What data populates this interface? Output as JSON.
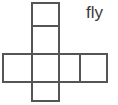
{
  "figure": {
    "kind": "cube-net-diagram",
    "label": "fly",
    "stroke_color": "#555555",
    "fill_color": "#ffffff",
    "background_color": "#ffffff",
    "stroke_width": 2,
    "canvas": {
      "width": 118,
      "height": 105
    },
    "grid": {
      "vertical_line_x": [
        2,
        31,
        60,
        80,
        108
      ],
      "horizontal_line_y": [
        2,
        26,
        54,
        82,
        102
      ]
    },
    "squares": [
      {
        "name": "top-cell",
        "x": 31,
        "y": 2,
        "width": 29,
        "height": 24
      },
      {
        "name": "upper-middle-cell",
        "x": 31,
        "y": 26,
        "width": 29,
        "height": 28
      },
      {
        "name": "center-cell",
        "x": 31,
        "y": 54,
        "width": 29,
        "height": 28
      },
      {
        "name": "bottom-cell",
        "x": 31,
        "y": 82,
        "width": 29,
        "height": 20
      },
      {
        "name": "left-cell",
        "x": 2,
        "y": 54,
        "width": 29,
        "height": 28
      },
      {
        "name": "right-inner-cell",
        "x": 60,
        "y": 54,
        "width": 20,
        "height": 28
      },
      {
        "name": "right-outer-cell",
        "x": 80,
        "y": 54,
        "width": 28,
        "height": 28
      }
    ]
  }
}
